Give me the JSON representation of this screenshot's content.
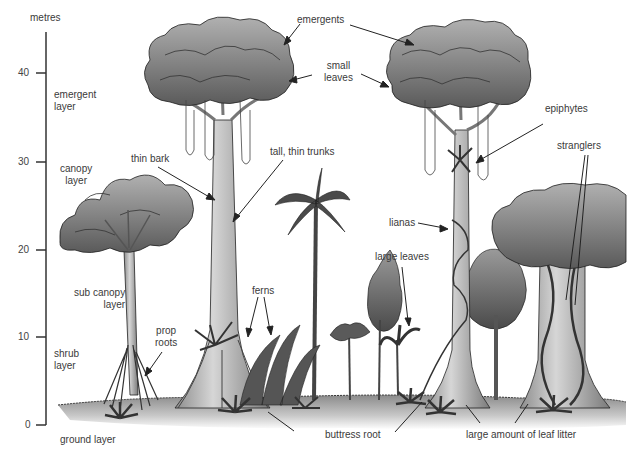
{
  "axis": {
    "unit_label": "metres",
    "ticks": [
      {
        "value": "40",
        "y": 73
      },
      {
        "value": "30",
        "y": 162
      },
      {
        "value": "20",
        "y": 250
      },
      {
        "value": "10",
        "y": 337
      },
      {
        "value": "0",
        "y": 425
      }
    ]
  },
  "layers": {
    "emergent": [
      "emergent",
      "layer"
    ],
    "canopy": [
      "canopy",
      "layer"
    ],
    "sub_canopy": [
      "sub canopy",
      "layer"
    ],
    "shrub": [
      "shrub",
      "layer"
    ],
    "ground": "ground layer"
  },
  "annotations": {
    "emergents": "emergents",
    "small_leaves": [
      "small",
      "leaves"
    ],
    "epiphytes": "epiphytes",
    "thin_bark": "thin bark",
    "tall_thin_trunks": "tall, thin trunks",
    "stranglers": "stranglers",
    "lianas": "lianas",
    "large_leaves": "large leaves",
    "ferns": "ferns",
    "prop_roots": [
      "prop",
      "roots"
    ],
    "buttress_root": "buttress root",
    "leaf_litter": "large amount of leaf litter"
  },
  "colors": {
    "foliage_light": "#a9a9a9",
    "foliage_mid": "#7d7d7d",
    "foliage_dark": "#555555",
    "trunk": "#bdbdbd",
    "outline": "#222222",
    "text": "#3a3a3a"
  }
}
